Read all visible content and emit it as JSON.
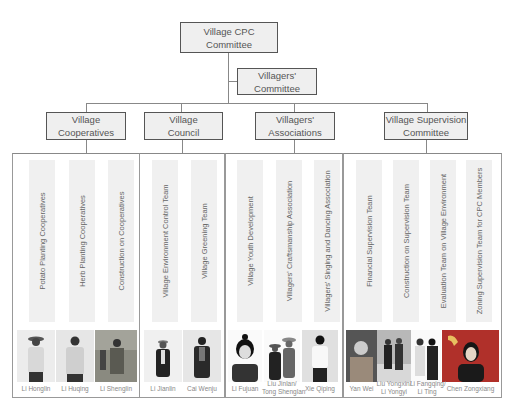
{
  "top": {
    "label_line1": "Village CPC",
    "label_line2": "Committee"
  },
  "second": {
    "label_line1": "Villagers'",
    "label_line2": "Committee"
  },
  "branches": [
    {
      "line1": "Village",
      "line2": "Cooperatives",
      "units": [
        "Potato Planting Cooperatives",
        "Herb Planting Cooperatives",
        "Construction on Cooperatives"
      ],
      "people": [
        "Li Honglin",
        "Li Huqing",
        "Li Shenglin"
      ]
    },
    {
      "line1": "Village",
      "line2": "Council",
      "units": [
        "Village Environment Control Team",
        "Village Greening Team"
      ],
      "people": [
        "Li Jianlin",
        "Cai Wenju"
      ]
    },
    {
      "line1": "Villagers'",
      "line2": "Associations",
      "units": [
        "Village Youth Development",
        "Villagers' Craftsmanship Association",
        "Villagers' Singing and Dancing Association"
      ],
      "people": [
        "Li Fujuan",
        "Liu Jinlan/ Tong Shenglan",
        "Xie Qiping"
      ]
    },
    {
      "line1": "Village Supervision",
      "line2": "Committee",
      "units": [
        "Financial Supervision Team",
        "Construction on Supervision Team",
        "Evaluation Team on Village Environment",
        "Zoning Supervision Team for CPC Members"
      ],
      "people": [
        "Yan Wei",
        "Liu Yongxin/ Li Yongyi",
        "Li Fangqing/ Li Ting",
        "Chen Zongxiang"
      ]
    }
  ],
  "people_split": {
    "p2_line1": "Liu Jinlan/",
    "p2_line2": "Tong Shenglan",
    "p4a_line1": "Liu Yongxin/",
    "p4a_line2": "Li Yongyi",
    "p4b_line1": "Li Fangqing/",
    "p4b_line2": "Li Ting"
  },
  "colors": {
    "box_fill": "#efefef",
    "box_border": "#555555",
    "connector": "#888888",
    "strip": "#f0f0f0",
    "party_red": "#b0302a"
  }
}
